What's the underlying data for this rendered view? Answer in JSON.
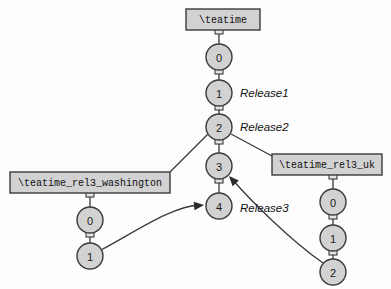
{
  "diagram": {
    "type": "version-control-branch-diagram",
    "background_color": "#fdfdfd",
    "node_fill_color": "#d2d2d2",
    "node_stroke_color": "#3a3a3a",
    "box_fill_color": "#d2d2d2"
  },
  "branches": {
    "trunk": {
      "box_label": "\\teatime",
      "box": {
        "x": 186,
        "y": 9,
        "w": 74,
        "h": 21
      },
      "nodes": [
        {
          "id": "0",
          "label": "0",
          "cx": 219,
          "cy": 57,
          "r": 13
        },
        {
          "id": "1",
          "label": "1",
          "cx": 219,
          "cy": 93,
          "r": 13
        },
        {
          "id": "2",
          "label": "2",
          "cx": 219,
          "cy": 127,
          "r": 13
        },
        {
          "id": "3",
          "label": "3",
          "cx": 219,
          "cy": 166,
          "r": 13
        },
        {
          "id": "4",
          "label": "4",
          "cx": 219,
          "cy": 206,
          "r": 13
        }
      ]
    },
    "washington": {
      "box_label": "\\teatime_rel3_washington",
      "box": {
        "x": 10,
        "y": 172,
        "w": 160,
        "h": 21
      },
      "nodes": [
        {
          "id": "0",
          "label": "0",
          "cx": 90,
          "cy": 220,
          "r": 13
        },
        {
          "id": "1",
          "label": "1",
          "cx": 90,
          "cy": 256,
          "r": 13
        }
      ]
    },
    "uk": {
      "box_label": "\\teatime_rel3_uk",
      "box": {
        "x": 272,
        "y": 154,
        "w": 110,
        "h": 21
      },
      "nodes": [
        {
          "id": "0",
          "label": "0",
          "cx": 333,
          "cy": 202,
          "r": 13
        },
        {
          "id": "1",
          "label": "1",
          "cx": 333,
          "cy": 238,
          "r": 13
        },
        {
          "id": "2",
          "label": "2",
          "cx": 333,
          "cy": 272,
          "r": 13
        }
      ]
    }
  },
  "release_labels": [
    {
      "text": "Release1",
      "x": 240,
      "y": 93
    },
    {
      "text": "Release2",
      "x": 240,
      "y": 127
    },
    {
      "text": "Release3",
      "x": 240,
      "y": 208
    }
  ],
  "connectors": [
    {
      "name": "trunk-box-to-0",
      "x": 219,
      "y": 30
    },
    {
      "name": "trunk-0-to-1",
      "x": 219,
      "y": 70
    },
    {
      "name": "trunk-1-to-2",
      "x": 219,
      "y": 106
    },
    {
      "name": "trunk-2-to-3",
      "x": 219,
      "y": 140
    },
    {
      "name": "trunk-3-to-4",
      "x": 219,
      "y": 179
    },
    {
      "name": "washington-box-to-0",
      "x": 90,
      "y": 193
    },
    {
      "name": "washington-0-to-1",
      "x": 90,
      "y": 233
    },
    {
      "name": "uk-box-to-0",
      "x": 333,
      "y": 175
    },
    {
      "name": "uk-0-to-1",
      "x": 333,
      "y": 215
    },
    {
      "name": "uk-1-to-2",
      "x": 333,
      "y": 251
    }
  ],
  "edges": [
    {
      "name": "trunk-box-0",
      "d": "M219,30 L219,44"
    },
    {
      "name": "trunk-0-1",
      "d": "M219,70 L219,80"
    },
    {
      "name": "trunk-1-2",
      "d": "M219,106 L219,114"
    },
    {
      "name": "trunk-2-3",
      "d": "M219,140 L219,153"
    },
    {
      "name": "trunk-3-4",
      "d": "M219,179 L219,193"
    },
    {
      "name": "branch-2-to-washington",
      "d": "M208,134 L170,172"
    },
    {
      "name": "branch-2-to-uk",
      "d": "M231,134 L272,156"
    },
    {
      "name": "washington-box-0",
      "d": "M90,193 L90,207"
    },
    {
      "name": "washington-0-1",
      "d": "M90,233 L90,243"
    },
    {
      "name": "uk-box-0",
      "d": "M333,175 L333,189"
    },
    {
      "name": "uk-0-1",
      "d": "M333,215 L333,225"
    },
    {
      "name": "uk-1-2",
      "d": "M333,251 L333,259"
    }
  ],
  "merges": [
    {
      "name": "washington-1-to-trunk-4",
      "d": "M101,250 C135,232 172,206 200,205",
      "arrow": {
        "x": 204,
        "y": 205,
        "angle": -6
      }
    },
    {
      "name": "uk-2-to-trunk-3",
      "d": "M323,263 C290,240 250,200 232,179",
      "arrow": {
        "x": 229,
        "y": 176,
        "angle": 228
      }
    }
  ]
}
